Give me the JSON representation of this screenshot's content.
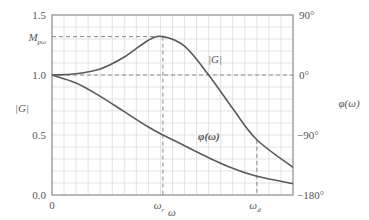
{
  "chart_data": {
    "type": "line",
    "title": "",
    "xlabel": "ω",
    "ylabel_left": "|G|",
    "ylabel_right": "φ(ω)",
    "ylim_left": [
      0.0,
      1.5
    ],
    "ylim_right_deg": [
      -180,
      90
    ],
    "grid": true,
    "x_ticks": [
      {
        "label": "0",
        "pos": 0.0
      },
      {
        "label": "ω_r",
        "pos": 0.46
      },
      {
        "label": "ω_d",
        "pos": 0.85
      }
    ],
    "y_ticks_left": [
      {
        "label": "0.0",
        "value": 0.0
      },
      {
        "label": "0.5",
        "value": 0.5
      },
      {
        "label": "1.0",
        "value": 1.0
      },
      {
        "label": "M_pω",
        "value": 1.32
      },
      {
        "label": "1.5",
        "value": 1.5
      }
    ],
    "y_ticks_right": [
      {
        "label": "90°",
        "value": 90
      },
      {
        "label": "0°",
        "value": 0
      },
      {
        "label": "−90°",
        "value": -90
      },
      {
        "label": "−180°",
        "value": -180
      }
    ],
    "reference_lines": [
      {
        "type": "horizontal",
        "axis": "left",
        "value": 1.0,
        "style": "dashed"
      },
      {
        "type": "horizontal",
        "axis": "left",
        "value": 1.32,
        "style": "dashed",
        "label": "M_pω"
      },
      {
        "type": "vertical",
        "x": 0.46,
        "style": "dashed",
        "label": "ω_r"
      },
      {
        "type": "vertical",
        "x": 0.85,
        "style": "dashed",
        "label": "ω_d"
      }
    ],
    "series": [
      {
        "name": "|G|",
        "axis": "left",
        "x": [
          0.0,
          0.1,
          0.2,
          0.3,
          0.4,
          0.46,
          0.55,
          0.65,
          0.75,
          0.85,
          1.0
        ],
        "values": [
          1.0,
          1.01,
          1.05,
          1.15,
          1.29,
          1.32,
          1.24,
          1.0,
          0.72,
          0.46,
          0.23
        ]
      },
      {
        "name": "φ(ω)",
        "axis": "right",
        "x": [
          0.0,
          0.1,
          0.2,
          0.3,
          0.4,
          0.46,
          0.55,
          0.65,
          0.75,
          0.85,
          1.0
        ],
        "values": [
          0,
          -12,
          -32,
          -55,
          -78,
          -90,
          -106,
          -124,
          -140,
          -152,
          -163
        ]
      }
    ],
    "annotations": [
      {
        "text": "|G|",
        "near_series": "|G|"
      },
      {
        "text": "φ(ω)",
        "near_series": "φ(ω)"
      }
    ]
  },
  "labels": {
    "left_axis": "|G|",
    "right_axis": "φ(ω)",
    "x_axis": "ω",
    "x_origin": "0",
    "omega_r": "ω",
    "omega_r_sub": "r",
    "omega_d": "ω",
    "omega_d_sub": "d",
    "mp": "M",
    "mp_sub": "pω",
    "y15": "1.5",
    "y10": "1.0",
    "y05": "0.5",
    "y00": "0.0",
    "r90": "90°",
    "r0": "0°",
    "rm90": "−90°",
    "rm180": "−180°",
    "g_curve": "|G|",
    "phi_curve": "φ(ω)"
  },
  "colors": {
    "curve": "#555555",
    "grid": "#dcdcdc",
    "axis": "#888888",
    "dash": "#888888"
  }
}
